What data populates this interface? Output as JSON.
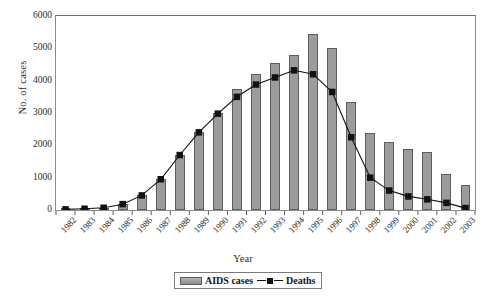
{
  "chart_data": {
    "type": "bar",
    "title": "",
    "xlabel": "Year",
    "ylabel": "No. of cases",
    "ylim": [
      0,
      6000
    ],
    "yticks": [
      0,
      1000,
      2000,
      3000,
      4000,
      5000,
      6000
    ],
    "grid": false,
    "legend_position": "bottom-center",
    "categories": [
      "1982",
      "1983",
      "1984",
      "1985",
      "1986",
      "1987",
      "1988",
      "1989",
      "1990",
      "1991",
      "1992",
      "1993",
      "1994",
      "1995",
      "1996",
      "1997",
      "1998",
      "1999",
      "2000",
      "2001",
      "2002",
      "2003"
    ],
    "series": [
      {
        "name": "AIDS cases",
        "type": "bar",
        "color": "#9c9c9c",
        "values": [
          20,
          40,
          70,
          180,
          450,
          950,
          1700,
          2400,
          3000,
          3750,
          4200,
          4550,
          4800,
          5450,
          5000,
          3350,
          2380,
          2100,
          1880,
          1800,
          1120,
          760
        ]
      },
      {
        "name": "Deaths",
        "type": "line",
        "color": "#111111",
        "marker": "square",
        "values": [
          20,
          40,
          70,
          180,
          450,
          950,
          1700,
          2400,
          2980,
          3500,
          3880,
          4100,
          4320,
          4200,
          3650,
          2250,
          1000,
          600,
          420,
          330,
          220,
          60
        ]
      }
    ]
  },
  "axis": {
    "y_title": "No. of cases",
    "x_title": "Year"
  },
  "legend": {
    "items": [
      {
        "label": "AIDS cases",
        "marker": "bar-swatch"
      },
      {
        "label": "Deaths",
        "marker": "line-square"
      }
    ]
  }
}
